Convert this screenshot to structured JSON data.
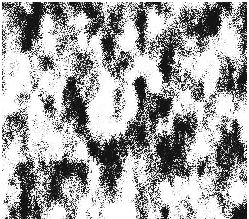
{
  "image": {
    "kind": "speckle-noise-texture",
    "description": "Dense irregular dark speckle and filament pattern on a white background, resembling a thresholded grayscale micrograph or halftone noise field",
    "width": 249,
    "height": 219,
    "background_color": "#ffffff",
    "speckle_color": "#141414",
    "midtone_color": "#6e6e6e",
    "coverage_percent": 38,
    "grain_scale_px": 2,
    "blob_elongation": 1.8,
    "contrast": "high",
    "palette": [
      "#ffffff",
      "#c8c8c8",
      "#8c8c8c",
      "#4a4a4a",
      "#141414"
    ],
    "margins": {
      "top_px": 2,
      "left_px": 2,
      "right_px": 2,
      "bottom_px": 0,
      "margin_color": "#ffffff"
    },
    "noise_seed": 20240517,
    "octaves": 4,
    "base_frequency": 0.085,
    "threshold": 0.52,
    "uniform_density": true,
    "regions_sampled": [
      {
        "name": "top-left",
        "x": 0,
        "y": 0,
        "w": 125,
        "h": 110,
        "density_percent": 37
      },
      {
        "name": "top-right",
        "x": 124,
        "y": 0,
        "w": 125,
        "h": 110,
        "density_percent": 39
      },
      {
        "name": "bottom-left",
        "x": 0,
        "y": 109,
        "w": 125,
        "h": 110,
        "density_percent": 38
      },
      {
        "name": "bottom-right",
        "x": 124,
        "y": 109,
        "w": 125,
        "h": 110,
        "density_percent": 38
      }
    ]
  }
}
